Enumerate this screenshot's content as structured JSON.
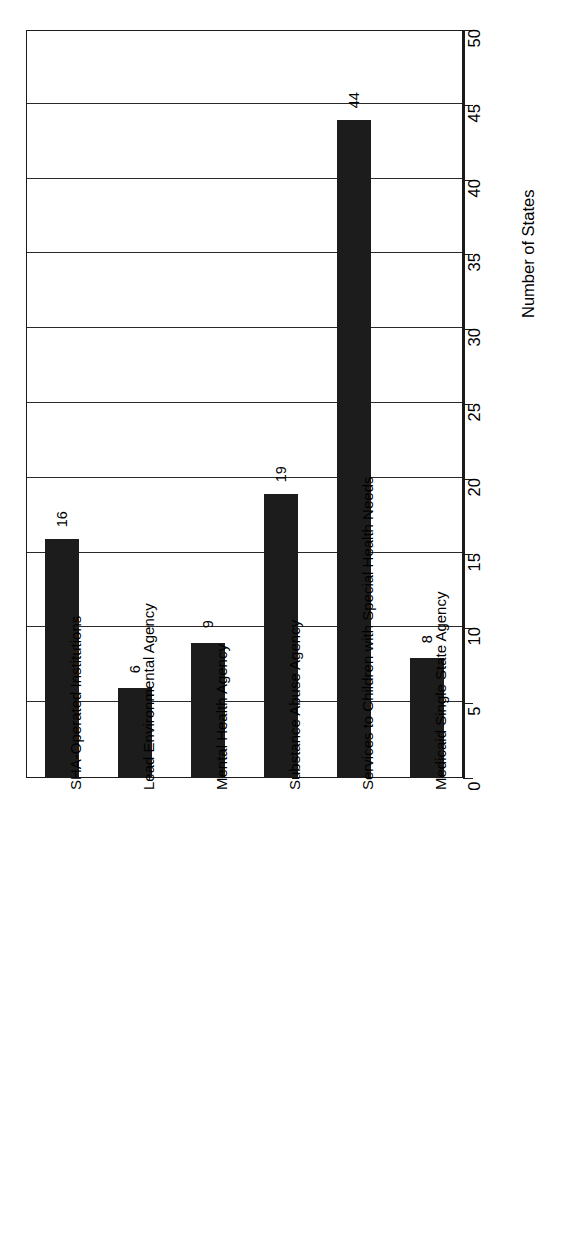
{
  "chart_data": {
    "type": "bar",
    "title": "",
    "subtitle": "",
    "orientation": "vertical-rotated-90",
    "categories": [
      "SHA-Operated Institutions",
      "Lead Environmental Agency",
      "Mental Health Agency",
      "Substance Abuse Agency",
      "Services to Children with Special Health Needs",
      "Medicaid Single State Agency"
    ],
    "values": [
      16,
      6,
      9,
      19,
      44,
      8
    ],
    "data_labels": [
      "16",
      "6",
      "9",
      "19",
      "44",
      "8"
    ],
    "xlabel": "",
    "ylabel": "Number of States",
    "ylim": [
      0,
      50
    ],
    "ytick_values": [
      0,
      5,
      10,
      15,
      20,
      25,
      30,
      35,
      40,
      45,
      50
    ],
    "ytick_labels": [
      "0",
      "5",
      "10",
      "15",
      "20",
      "25",
      "30",
      "35",
      "40",
      "45",
      "50"
    ],
    "grid": true,
    "grid_axis": "value",
    "legend": false,
    "legend_position": "none",
    "bar_color": "#1c1c1c",
    "axis_color": "#1b1b1b",
    "background_color": "#ffffff"
  },
  "axis": {
    "value_axis_title": "Number of States"
  }
}
